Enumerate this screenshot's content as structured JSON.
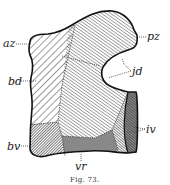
{
  "figure": {
    "caption": "Fig. 73.",
    "labels": {
      "az": "az",
      "pz": "pz",
      "jd": "jd",
      "bd": "bd",
      "bv": "bv",
      "vr": "vr",
      "iv": "iv"
    }
  }
}
